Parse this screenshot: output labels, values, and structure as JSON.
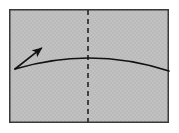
{
  "figure": {
    "kind": "origami-fold-diagram",
    "title": "Paper sheet with vertical dashed crease line and curved valley fold with motion arrow",
    "canvas": {
      "width": 179,
      "height": 133,
      "background_color": "#ffffff"
    },
    "sheet": {
      "name": "paper-sheet",
      "x": 9,
      "y": 9,
      "width": 160,
      "height": 114,
      "fill_color": "#bfbfbf",
      "stroke_color": "#3a3a3a",
      "stroke_width": 1.6
    },
    "crease_line": {
      "name": "vertical-crease",
      "style": "dashed",
      "x": 88,
      "y_start": 10,
      "y_end": 122,
      "stroke_color": "#2b2b2b",
      "stroke_width": 1.7,
      "dash_on": 5,
      "dash_off": 4
    },
    "fold_curve": {
      "name": "curved-fold-line",
      "style": "solid-curve",
      "start_x": 15,
      "start_y": 69,
      "apex_x": 92,
      "apex_y": 58,
      "end_x": 169,
      "end_y": 71,
      "stroke_color": "#111111",
      "stroke_width": 1.7
    },
    "motion_arrow": {
      "name": "fold-direction-arrow",
      "tail_x": 15,
      "tail_y": 69,
      "head_x": 43,
      "head_y": 47,
      "stroke_color": "#111111",
      "stroke_width": 1.6,
      "head_length": 9,
      "head_width": 6
    },
    "texture": {
      "enabled": true,
      "tint_color": "#b5b5b5",
      "opacity": 0.35
    }
  }
}
